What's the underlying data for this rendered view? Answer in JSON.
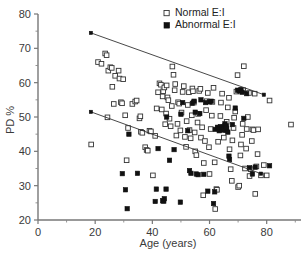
{
  "chart_data": {
    "type": "scatter",
    "title": "",
    "xlabel": "Age (years)",
    "ylabel": "PD %",
    "xlim": [
      0,
      92
    ],
    "ylim": [
      20,
      80
    ],
    "xticks": [
      0,
      20,
      40,
      60,
      80
    ],
    "yticks": [
      20,
      30,
      40,
      50,
      60,
      70,
      80
    ],
    "xtick_labels": [
      "0",
      "20",
      "40",
      "60",
      "80"
    ],
    "ytick_labels": [
      "20",
      "30",
      "40",
      "50",
      "60",
      "70",
      "80"
    ],
    "grid": false,
    "legend_position": "top-center",
    "legend": [
      {
        "name": "Normal E:I",
        "marker": "open-square"
      },
      {
        "name": "Abnormal E:I",
        "marker": "filled-square"
      }
    ],
    "annotations": [
      {
        "text": "upper regression line for Normal E:I group"
      },
      {
        "text": "lower regression line for Abnormal E:I group"
      }
    ],
    "regression_lines": [
      {
        "name": "Normal E:I trend",
        "x": [
          18.5,
          79.0
        ],
        "y": [
          74.5,
          56.5
        ]
      },
      {
        "name": "Abnormal E:I trend",
        "x": [
          18.5,
          78.0
        ],
        "y": [
          51.5,
          33.5
        ]
      }
    ],
    "series": [
      {
        "name": "Normal E:I",
        "marker": "open-square",
        "points": [
          [
            18.6,
            42.0
          ],
          [
            21.0,
            66.0
          ],
          [
            22.2,
            65.5
          ],
          [
            23.5,
            68.5
          ],
          [
            24.0,
            68.0
          ],
          [
            24.3,
            49.9
          ],
          [
            24.6,
            63.5
          ],
          [
            25.3,
            64.5
          ],
          [
            25.8,
            64.3
          ],
          [
            26.0,
            58.8
          ],
          [
            26.5,
            53.8
          ],
          [
            27.0,
            62.0
          ],
          [
            28.2,
            63.5
          ],
          [
            28.5,
            61.2
          ],
          [
            29.0,
            54.3
          ],
          [
            29.4,
            54.0
          ],
          [
            29.8,
            61.0
          ],
          [
            30.5,
            50.5
          ],
          [
            31.0,
            37.4
          ],
          [
            31.5,
            46.8
          ],
          [
            33.0,
            53.8
          ],
          [
            34.0,
            54.5
          ],
          [
            34.5,
            54.8
          ],
          [
            35.5,
            49.6
          ],
          [
            35.8,
            50.2
          ],
          [
            36.0,
            45.7
          ],
          [
            36.5,
            45.4
          ],
          [
            37.5,
            41.2
          ],
          [
            38.0,
            40.4
          ],
          [
            38.4,
            40.2
          ],
          [
            39.0,
            46.0
          ],
          [
            39.5,
            45.8
          ],
          [
            40.2,
            33.0
          ],
          [
            41.0,
            44.5
          ],
          [
            41.5,
            52.5
          ],
          [
            42.0,
            57.2
          ],
          [
            42.5,
            59.8
          ],
          [
            43.0,
            59.4
          ],
          [
            43.3,
            52.2
          ],
          [
            43.6,
            56.0
          ],
          [
            43.8,
            57.5
          ],
          [
            44.2,
            58.6
          ],
          [
            44.5,
            47.9
          ],
          [
            44.8,
            51.0
          ],
          [
            45.0,
            59.2
          ],
          [
            45.3,
            55.7
          ],
          [
            45.6,
            54.9
          ],
          [
            46.0,
            49.5
          ],
          [
            46.4,
            47.3
          ],
          [
            46.8,
            53.2
          ],
          [
            47.0,
            64.7
          ],
          [
            47.4,
            62.3
          ],
          [
            47.8,
            57.8
          ],
          [
            48.0,
            59.6
          ],
          [
            48.4,
            44.6
          ],
          [
            48.8,
            48.0
          ],
          [
            49.0,
            54.3
          ],
          [
            49.4,
            53.9
          ],
          [
            49.8,
            46.1
          ],
          [
            50.2,
            51.3
          ],
          [
            50.6,
            57.3
          ],
          [
            51.0,
            59.0
          ],
          [
            51.4,
            44.2
          ],
          [
            51.8,
            41.3
          ],
          [
            52.0,
            48.8
          ],
          [
            52.4,
            53.5
          ],
          [
            52.8,
            57.2
          ],
          [
            53.0,
            46.2
          ],
          [
            53.4,
            43.8
          ],
          [
            53.8,
            50.5
          ],
          [
            54.0,
            58.3
          ],
          [
            54.2,
            57.5
          ],
          [
            54.5,
            54.2
          ],
          [
            54.8,
            45.5
          ],
          [
            55.0,
            40.0
          ],
          [
            55.4,
            38.9
          ],
          [
            55.8,
            48.4
          ],
          [
            56.0,
            50.9
          ],
          [
            56.4,
            57.6
          ],
          [
            56.8,
            58.2
          ],
          [
            57.0,
            44.0
          ],
          [
            57.4,
            47.0
          ],
          [
            57.8,
            27.2
          ],
          [
            58.0,
            36.6
          ],
          [
            58.4,
            43.0
          ],
          [
            58.8,
            52.0
          ],
          [
            59.0,
            54.6
          ],
          [
            59.4,
            57.0
          ],
          [
            59.8,
            41.2
          ],
          [
            60.0,
            33.4
          ],
          [
            60.4,
            46.5
          ],
          [
            60.8,
            50.4
          ],
          [
            61.0,
            54.4
          ],
          [
            61.4,
            58.5
          ],
          [
            61.8,
            36.8
          ],
          [
            62.0,
            23.2
          ],
          [
            62.4,
            29.0
          ],
          [
            62.6,
            28.8
          ],
          [
            63.0,
            42.8
          ],
          [
            63.4,
            46.6
          ],
          [
            63.8,
            50.3
          ],
          [
            64.0,
            54.2
          ],
          [
            64.4,
            56.8
          ],
          [
            64.8,
            47.0
          ],
          [
            65.0,
            44.0
          ],
          [
            65.4,
            47.4
          ],
          [
            65.8,
            46.2
          ],
          [
            66.0,
            48.6
          ],
          [
            66.4,
            52.8
          ],
          [
            66.8,
            55.6
          ],
          [
            67.0,
            40.6
          ],
          [
            67.4,
            34.8
          ],
          [
            67.8,
            31.4
          ],
          [
            68.0,
            43.2
          ],
          [
            68.4,
            46.8
          ],
          [
            68.6,
            49.8
          ],
          [
            69.0,
            51.6
          ],
          [
            69.4,
            57.4
          ],
          [
            69.8,
            62.2
          ],
          [
            70.0,
            29.6
          ],
          [
            70.4,
            30.0
          ],
          [
            70.8,
            38.8
          ],
          [
            71.0,
            42.0
          ],
          [
            71.4,
            44.8
          ],
          [
            71.6,
            48.0
          ],
          [
            71.8,
            57.8
          ],
          [
            72.0,
            64.8
          ],
          [
            72.4,
            35.0
          ],
          [
            72.8,
            40.8
          ],
          [
            73.0,
            46.5
          ],
          [
            73.4,
            50.0
          ],
          [
            73.8,
            57.0
          ],
          [
            74.0,
            32.8
          ],
          [
            74.4,
            34.8
          ],
          [
            74.8,
            43.0
          ],
          [
            75.0,
            46.4
          ],
          [
            75.4,
            46.2
          ],
          [
            75.8,
            56.8
          ],
          [
            76.0,
            27.6
          ],
          [
            76.4,
            35.6
          ],
          [
            76.8,
            39.2
          ],
          [
            77.0,
            46.4
          ],
          [
            78.0,
            33.0
          ],
          [
            79.0,
            36.0
          ],
          [
            80.0,
            33.0
          ],
          [
            81.0,
            54.8
          ],
          [
            88.5,
            47.8
          ]
        ]
      },
      {
        "name": "Abnormal E:I",
        "marker": "filled-square",
        "points": [
          [
            29.5,
            33.5
          ],
          [
            30.6,
            28.8
          ],
          [
            31.2,
            23.3
          ],
          [
            31.8,
            45.0
          ],
          [
            34.8,
            33.6
          ],
          [
            41.0,
            25.4
          ],
          [
            41.4,
            29.0
          ],
          [
            42.0,
            40.8
          ],
          [
            43.6,
            25.6
          ],
          [
            44.0,
            25.5
          ],
          [
            44.2,
            26.2
          ],
          [
            44.8,
            29.0
          ],
          [
            45.0,
            50.0
          ],
          [
            46.0,
            37.4
          ],
          [
            47.6,
            40.5
          ],
          [
            49.8,
            25.2
          ],
          [
            50.0,
            50.8
          ],
          [
            52.4,
            46.0
          ],
          [
            53.0,
            34.4
          ],
          [
            53.5,
            33.6
          ],
          [
            54.0,
            54.0
          ],
          [
            55.0,
            51.4
          ],
          [
            55.4,
            33.4
          ],
          [
            56.0,
            33.2
          ],
          [
            56.6,
            51.0
          ],
          [
            57.0,
            55.0
          ],
          [
            58.0,
            33.3
          ],
          [
            59.4,
            28.4
          ],
          [
            60.0,
            54.4
          ],
          [
            61.4,
            24.8
          ],
          [
            61.8,
            28.2
          ],
          [
            62.0,
            46.4
          ],
          [
            62.8,
            47.0
          ],
          [
            63.0,
            46.8
          ],
          [
            63.4,
            46.0
          ],
          [
            63.8,
            47.2
          ],
          [
            64.0,
            46.4
          ],
          [
            64.4,
            46.6
          ],
          [
            64.8,
            47.0
          ],
          [
            65.0,
            46.2
          ],
          [
            65.4,
            48.0
          ],
          [
            65.8,
            47.4
          ],
          [
            66.0,
            46.8
          ],
          [
            66.4,
            45.6
          ],
          [
            66.8,
            38.6
          ],
          [
            67.0,
            37.6
          ],
          [
            68.0,
            47.8
          ],
          [
            69.0,
            52.6
          ],
          [
            69.8,
            57.8
          ],
          [
            70.4,
            57.6
          ],
          [
            71.0,
            58.0
          ],
          [
            71.4,
            57.2
          ],
          [
            72.0,
            49.6
          ],
          [
            73.0,
            56.8
          ],
          [
            74.0,
            35.2
          ],
          [
            75.0,
            33.4
          ],
          [
            76.0,
            35.4
          ],
          [
            81.0,
            35.8
          ],
          [
            54.6,
            54.6
          ],
          [
            58.6,
            54.2
          ],
          [
            60.6,
            54.6
          ],
          [
            50.6,
            54.2
          ]
        ]
      }
    ]
  },
  "axis": {
    "y_title": "PD %",
    "x_title": "Age (years)"
  }
}
